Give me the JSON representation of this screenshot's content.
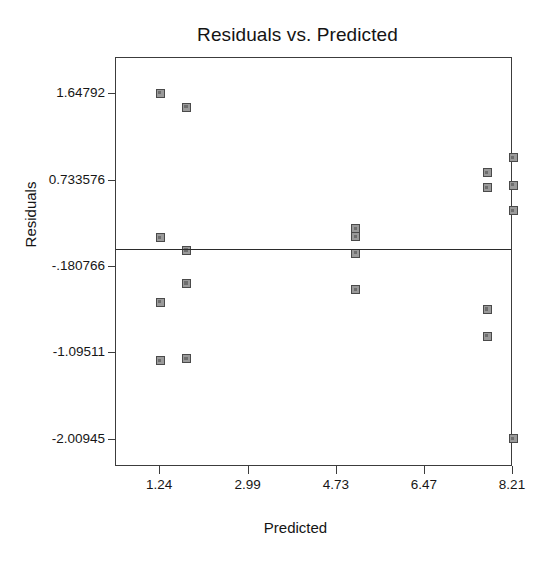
{
  "chart_data": {
    "type": "scatter",
    "title": "Residuals vs. Predicted",
    "xlabel": "Predicted",
    "ylabel": "Residuals",
    "xlim": [
      0.37,
      8.21
    ],
    "ylim": [
      -2.31,
      2.02
    ],
    "grid": false,
    "legend": null,
    "xticks": [
      1.24,
      2.99,
      4.73,
      6.47,
      8.21
    ],
    "xtick_labels": [
      "1.24",
      "2.99",
      "4.73",
      "6.47",
      "8.21"
    ],
    "yticks": [
      1.64792,
      0.733576,
      -0.180766,
      -1.09511,
      -2.00945
    ],
    "ytick_labels": [
      "1.64792",
      "0.733576",
      "-.180766",
      "-1.09511",
      "-2.00945"
    ],
    "reference_line": {
      "orientation": "horizontal",
      "y": 0.0,
      "label": ""
    },
    "marker": {
      "shape": "square",
      "fill_color": "#9a9a9a",
      "edge_color": "#4a4a4a",
      "size_px": 9
    },
    "points": [
      {
        "x": 1.24,
        "y": 1.64792
      },
      {
        "x": 1.76,
        "y": 1.5
      },
      {
        "x": 1.24,
        "y": 0.115
      },
      {
        "x": 1.76,
        "y": -0.015
      },
      {
        "x": 1.76,
        "y": -0.365
      },
      {
        "x": 1.24,
        "y": -0.565
      },
      {
        "x": 1.24,
        "y": -1.185
      },
      {
        "x": 1.76,
        "y": -1.165
      },
      {
        "x": 5.1,
        "y": 0.215
      },
      {
        "x": 5.1,
        "y": 0.125
      },
      {
        "x": 5.1,
        "y": -0.045
      },
      {
        "x": 5.1,
        "y": -0.435
      },
      {
        "x": 7.7,
        "y": 0.805
      },
      {
        "x": 8.21,
        "y": 0.965
      },
      {
        "x": 7.7,
        "y": 0.645
      },
      {
        "x": 8.21,
        "y": 0.675
      },
      {
        "x": 8.21,
        "y": 0.405
      },
      {
        "x": 7.7,
        "y": -0.64
      },
      {
        "x": 7.7,
        "y": -0.925
      },
      {
        "x": 8.21,
        "y": -2.00945
      }
    ]
  },
  "colors": {
    "frame": "#3c3c3c",
    "reference_line": "#2b2b2b",
    "text": "#141414",
    "background": "#ffffff"
  }
}
